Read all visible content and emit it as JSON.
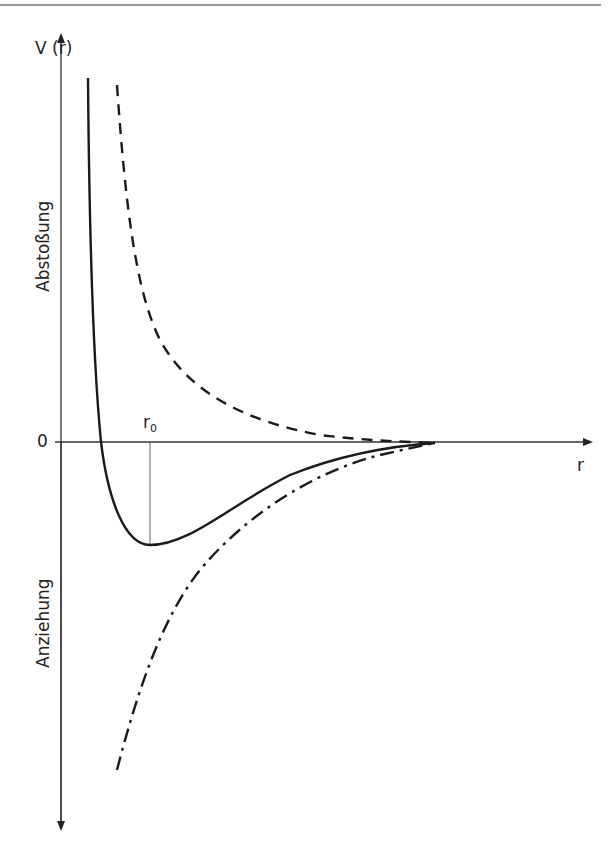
{
  "diagram": {
    "y_axis_label": "V (r)",
    "x_axis_label": "r",
    "zero_label": "0",
    "r0_label": "r",
    "r0_subscript": "0",
    "upper_region_label": "Abstoßung",
    "lower_region_label": "Anziehung",
    "curves": [
      {
        "name": "total-potential",
        "style": "solid"
      },
      {
        "name": "repulsive-potential",
        "style": "dashed"
      },
      {
        "name": "attractive-potential",
        "style": "dash-dot"
      }
    ],
    "colors": {
      "line": "#1a1a1a",
      "axis": "#333333",
      "rule": "#9a9a9a"
    }
  }
}
